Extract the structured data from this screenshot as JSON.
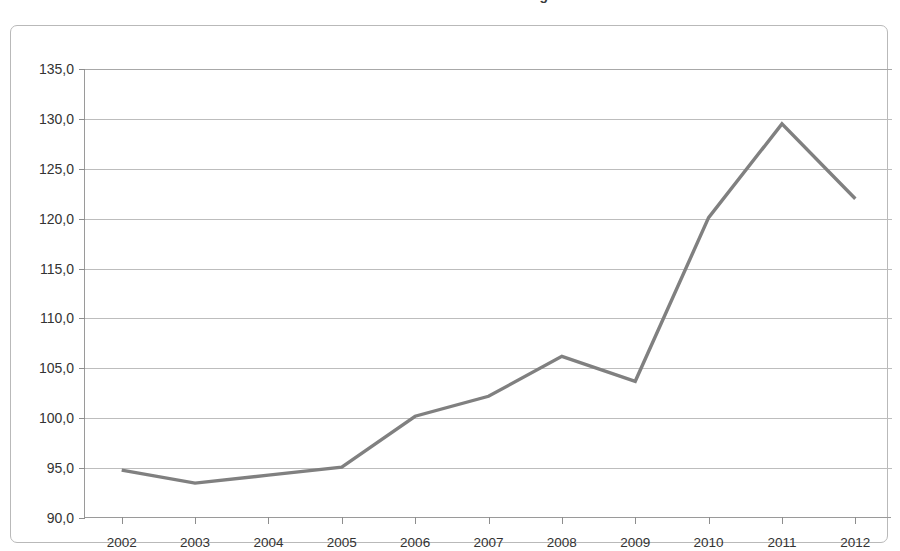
{
  "chart_data": {
    "type": "line",
    "title": "Indice des termes de l'échange",
    "xlabel": "",
    "ylabel": "",
    "categories": [
      "2002",
      "2003",
      "2004",
      "2005",
      "2006",
      "2007",
      "2008",
      "2009",
      "2010",
      "2011",
      "2012"
    ],
    "values": [
      94.8,
      93.5,
      94.3,
      95.1,
      100.2,
      102.2,
      106.2,
      103.7,
      120.1,
      129.5,
      122.0
    ],
    "series": [
      {
        "name": "Indice des termes de l'échange",
        "values": [
          94.8,
          93.5,
          94.3,
          95.1,
          100.2,
          102.2,
          106.2,
          103.7,
          120.1,
          129.5,
          122.0
        ]
      }
    ],
    "ylim": [
      90.0,
      135.0
    ],
    "ytick_step": 5.0,
    "ytick_labels": [
      "135,0",
      "130,0",
      "125,0",
      "120,0",
      "115,0",
      "110,0",
      "105,0",
      "100,0",
      "95,0",
      "90,0"
    ],
    "ytick_values": [
      135.0,
      130.0,
      125.0,
      120.0,
      115.0,
      110.0,
      105.0,
      100.0,
      95.0,
      90.0
    ],
    "xtick_labels": [
      "2002",
      "2003",
      "2004",
      "2005",
      "2006",
      "2007",
      "2008",
      "2009",
      "2010",
      "2011",
      "2012"
    ],
    "grid": "horizontal",
    "legend": "none",
    "decimal_separator": ",",
    "colors": {
      "line": "#808080",
      "gridline": "#bdbdbd",
      "axis": "#9a9a9a",
      "frame": "#b9b9b9",
      "text": "#333333",
      "background": "#ffffff"
    },
    "line_width": 3.4
  }
}
